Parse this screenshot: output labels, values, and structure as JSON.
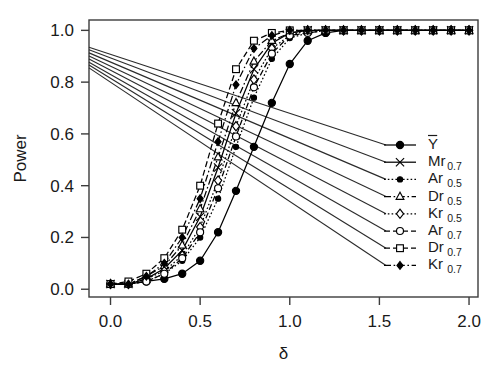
{
  "chart_data": {
    "type": "line",
    "title": "",
    "xlabel": "δ",
    "ylabel": "Power",
    "xlim": [
      -0.12,
      2.05
    ],
    "ylim": [
      -0.03,
      1.04
    ],
    "xticks": [
      0.0,
      0.5,
      1.0,
      1.5,
      2.0
    ],
    "xticklabels": [
      "0.0",
      "0.5",
      "1.0",
      "1.5",
      "2.0"
    ],
    "yticks": [
      0.0,
      0.2,
      0.4,
      0.6,
      0.8,
      1.0
    ],
    "yticklabels": [
      "0.0",
      "0.2",
      "0.4",
      "0.6",
      "0.8",
      "1.0"
    ],
    "grid": false,
    "legend_position": "right-middle",
    "x": [
      0.0,
      0.1,
      0.2,
      0.3,
      0.4,
      0.5,
      0.6,
      0.7,
      0.8,
      0.9,
      1.0,
      1.1,
      1.2,
      1.3,
      1.4,
      1.5,
      1.6,
      1.7,
      1.8,
      1.9,
      2.0
    ],
    "series": [
      {
        "name": "Ybar",
        "label": "Y",
        "label_overbar": true,
        "subscript": "",
        "marker": "filled-circle",
        "dash": "solid",
        "values": [
          0.02,
          0.02,
          0.03,
          0.04,
          0.06,
          0.11,
          0.22,
          0.38,
          0.55,
          0.72,
          0.87,
          0.96,
          0.99,
          1.0,
          1.0,
          1.0,
          1.0,
          1.0,
          1.0,
          1.0,
          1.0
        ]
      },
      {
        "name": "Mr07",
        "label": "Mr",
        "label_overbar": false,
        "subscript": "0.7",
        "marker": "cross",
        "dash": "solid",
        "values": [
          0.02,
          0.02,
          0.04,
          0.08,
          0.15,
          0.28,
          0.47,
          0.68,
          0.85,
          0.95,
          0.99,
          1.0,
          1.0,
          1.0,
          1.0,
          1.0,
          1.0,
          1.0,
          1.0,
          1.0,
          1.0
        ]
      },
      {
        "name": "Ar05",
        "label": "Ar",
        "label_overbar": false,
        "subscript": "0.5",
        "marker": "small-filled-circle",
        "dash": "dotted",
        "values": [
          0.02,
          0.02,
          0.03,
          0.06,
          0.11,
          0.2,
          0.35,
          0.55,
          0.74,
          0.89,
          0.97,
          0.99,
          1.0,
          1.0,
          1.0,
          1.0,
          1.0,
          1.0,
          1.0,
          1.0,
          1.0
        ]
      },
      {
        "name": "Dr05",
        "label": "Dr",
        "label_overbar": false,
        "subscript": "0.5",
        "marker": "open-triangle",
        "dash": "dashdot",
        "values": [
          0.02,
          0.02,
          0.05,
          0.09,
          0.17,
          0.31,
          0.51,
          0.72,
          0.88,
          0.96,
          0.99,
          1.0,
          1.0,
          1.0,
          1.0,
          1.0,
          1.0,
          1.0,
          1.0,
          1.0,
          1.0
        ]
      },
      {
        "name": "Kr05",
        "label": "Kr",
        "label_overbar": false,
        "subscript": "0.5",
        "marker": "open-diamond",
        "dash": "dotted",
        "values": [
          0.02,
          0.02,
          0.04,
          0.07,
          0.13,
          0.24,
          0.42,
          0.63,
          0.81,
          0.93,
          0.98,
          1.0,
          1.0,
          1.0,
          1.0,
          1.0,
          1.0,
          1.0,
          1.0,
          1.0,
          1.0
        ]
      },
      {
        "name": "Ar07",
        "label": "Ar",
        "label_overbar": false,
        "subscript": "0.7",
        "marker": "open-circle",
        "dash": "dashed",
        "values": [
          0.02,
          0.02,
          0.03,
          0.06,
          0.12,
          0.22,
          0.39,
          0.59,
          0.78,
          0.91,
          0.98,
          0.99,
          1.0,
          1.0,
          1.0,
          1.0,
          1.0,
          1.0,
          1.0,
          1.0,
          1.0
        ]
      },
      {
        "name": "Dr07",
        "label": "Dr",
        "label_overbar": false,
        "subscript": "0.7",
        "marker": "open-square",
        "dash": "dashed",
        "values": [
          0.02,
          0.03,
          0.06,
          0.12,
          0.23,
          0.4,
          0.64,
          0.85,
          0.96,
          0.99,
          1.0,
          1.0,
          1.0,
          1.0,
          1.0,
          1.0,
          1.0,
          1.0,
          1.0,
          1.0,
          1.0
        ]
      },
      {
        "name": "Kr07",
        "label": "Kr",
        "label_overbar": false,
        "subscript": "0.7",
        "marker": "filled-diamond",
        "dash": "dashdot",
        "values": [
          0.02,
          0.02,
          0.05,
          0.1,
          0.2,
          0.35,
          0.57,
          0.79,
          0.93,
          0.98,
          1.0,
          1.0,
          1.0,
          1.0,
          1.0,
          1.0,
          1.0,
          1.0,
          1.0,
          1.0,
          1.0
        ]
      }
    ],
    "leader_lines": {
      "description": "Straight pointer lines drawn from the left frame edge to each legend key",
      "origin_x": -0.12,
      "origin_y_values": [
        0.935,
        0.925,
        0.913,
        0.901,
        0.889,
        0.877,
        0.866,
        0.855
      ]
    }
  },
  "legend": {
    "entries": [
      {
        "key": "legend-item-ybar",
        "label": "Y",
        "overbar": true,
        "subscript": ""
      },
      {
        "key": "legend-item-mr07",
        "label": "Mr",
        "overbar": false,
        "subscript": "0.7"
      },
      {
        "key": "legend-item-ar05",
        "label": "Ar",
        "overbar": false,
        "subscript": "0.5"
      },
      {
        "key": "legend-item-dr05",
        "label": "Dr",
        "overbar": false,
        "subscript": "0.5"
      },
      {
        "key": "legend-item-kr05",
        "label": "Kr",
        "overbar": false,
        "subscript": "0.5"
      },
      {
        "key": "legend-item-ar07",
        "label": "Ar",
        "overbar": false,
        "subscript": "0.7"
      },
      {
        "key": "legend-item-dr07",
        "label": "Dr",
        "overbar": false,
        "subscript": "0.7"
      },
      {
        "key": "legend-item-kr07",
        "label": "Kr",
        "overbar": false,
        "subscript": "0.7"
      }
    ]
  },
  "colors": {
    "background": "#ffffff",
    "ink": "#000000",
    "axis": "#3c3c3c"
  }
}
